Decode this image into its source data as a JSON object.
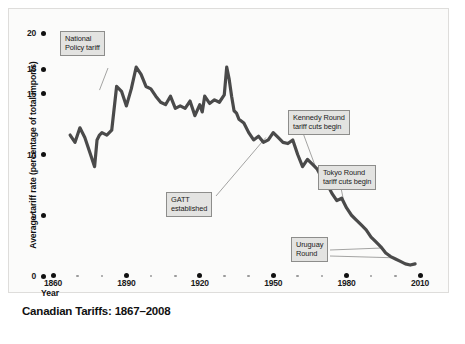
{
  "chart_data": {
    "type": "line",
    "title": "Canadian Tariffs: 1867–2008",
    "xlabel": "Year",
    "ylabel": "Average tariff rate (percentage of total imports)",
    "xlim": [
      1860,
      2010
    ],
    "ylim": [
      0,
      20
    ],
    "grid": false,
    "legend": "none",
    "xticks": [
      "1860",
      "1890",
      "1920",
      "1950",
      "1980",
      "2010"
    ],
    "xtick_values": [
      1860,
      1890,
      1920,
      1950,
      1980,
      2010
    ],
    "yticks": [
      "20",
      "15",
      "15",
      "10",
      "5",
      "0"
    ],
    "ytick_values": [
      20,
      17,
      15,
      10,
      5,
      0
    ],
    "series": [
      {
        "name": "Average tariff rate",
        "x": [
          1867,
          1869,
          1871,
          1873,
          1875,
          1877,
          1878,
          1879,
          1880,
          1882,
          1884,
          1886,
          1888,
          1890,
          1892,
          1894,
          1896,
          1898,
          1900,
          1902,
          1904,
          1906,
          1908,
          1910,
          1912,
          1914,
          1916,
          1918,
          1920,
          1921,
          1922,
          1924,
          1926,
          1928,
          1930,
          1931,
          1932,
          1933,
          1934,
          1935,
          1936,
          1938,
          1940,
          1942,
          1944,
          1946,
          1948,
          1950,
          1952,
          1954,
          1956,
          1958,
          1960,
          1962,
          1964,
          1966,
          1968,
          1970,
          1972,
          1974,
          1976,
          1978,
          1980,
          1982,
          1984,
          1986,
          1988,
          1990,
          1992,
          1994,
          1996,
          1998,
          2000,
          2002,
          2004,
          2006,
          2008
        ],
        "y": [
          11.6,
          11.0,
          12.2,
          11.4,
          10.2,
          9.0,
          11.2,
          11.6,
          11.8,
          11.6,
          12.0,
          15.6,
          15.2,
          14.0,
          15.4,
          17.2,
          16.6,
          15.6,
          15.4,
          14.8,
          14.3,
          14.1,
          14.8,
          13.8,
          14.0,
          13.8,
          14.4,
          13.2,
          14.1,
          13.5,
          14.8,
          14.2,
          14.5,
          14.3,
          14.9,
          17.2,
          16.2,
          14.8,
          13.6,
          13.4,
          12.9,
          12.6,
          11.8,
          11.2,
          11.5,
          11.0,
          11.2,
          11.8,
          11.4,
          11.0,
          10.9,
          11.2,
          10.0,
          9.0,
          9.6,
          9.2,
          8.8,
          8.0,
          7.6,
          6.8,
          6.2,
          6.4,
          5.6,
          5.0,
          4.6,
          4.2,
          3.8,
          3.2,
          2.8,
          2.4,
          1.9,
          1.6,
          1.4,
          1.2,
          1.0,
          0.9,
          1.0
        ],
        "color": "#4a4a4a"
      }
    ],
    "annotations": [
      {
        "id": "national",
        "label": "National\nPolicy tariff",
        "target_x": 1879,
        "target_y": 15.3
      },
      {
        "id": "gatt",
        "label": "GATT\nestablished",
        "target_x": 1947,
        "target_y": 11.4
      },
      {
        "id": "kennedy",
        "label": "Kennedy Round\ntariff cuts begin",
        "target_x": 1968,
        "target_y": 8.6
      },
      {
        "id": "tokyo",
        "label": "Tokyo Round\ntariff cuts begin",
        "target_x": 1979,
        "target_y": 6.0
      },
      {
        "id": "uruguay",
        "label": "Uruguay\nRound",
        "target_x": 1994,
        "target_y": 2.3
      }
    ]
  },
  "axes": {
    "y_title": "Average tariff rate (percentage of total imports)",
    "x_title": "Year",
    "y_ticks": [
      {
        "label": "20",
        "value": 20
      },
      {
        "label": "15",
        "value": 17
      },
      {
        "label": "15",
        "value": 15
      },
      {
        "label": "10",
        "value": 10
      },
      {
        "label": "5",
        "value": 5
      },
      {
        "label": "0",
        "value": 0
      }
    ],
    "x_ticks": [
      {
        "label": "1860",
        "value": 1860
      },
      {
        "label": "1890",
        "value": 1890
      },
      {
        "label": "1920",
        "value": 1920
      },
      {
        "label": "1950",
        "value": 1950
      },
      {
        "label": "1980",
        "value": 1980
      },
      {
        "label": "2010",
        "value": 2010
      }
    ]
  },
  "callouts": {
    "national": "National\nPolicy tariff",
    "gatt": "GATT\nestablished",
    "kennedy": "Kennedy Round\ntariff cuts begin",
    "tokyo": "Tokyo Round\ntariff cuts begin",
    "uruguay": "Uruguay\nRound"
  },
  "title": "Canadian Tariffs: 1867–2008",
  "colors": {
    "line": "#4a4a4a",
    "callout_fill": "#e3e3e1",
    "callout_border": "#8d8d8b",
    "text": "#111111",
    "plate": "#fbfbfa"
  }
}
